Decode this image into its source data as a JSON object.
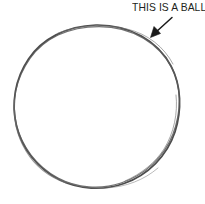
{
  "figure": {
    "background_color": "#ffffff",
    "width": 205,
    "height": 204
  },
  "annotation": {
    "label": "THIS IS A BALL",
    "text_color": "#231f20",
    "arrow": {
      "name": "pointer-arrow",
      "color": "#1a1a1a",
      "direction": "down-left",
      "from": [
        172,
        18
      ],
      "to": [
        151,
        37
      ]
    }
  },
  "shape": {
    "name": "ball-outline",
    "kind": "circle",
    "stroke_color": "#4a4a4a",
    "fill_color": "#ffffff",
    "center": [
      97,
      106
    ],
    "radius_x": 84,
    "radius_y": 81,
    "style": "sketchy double stroke"
  }
}
